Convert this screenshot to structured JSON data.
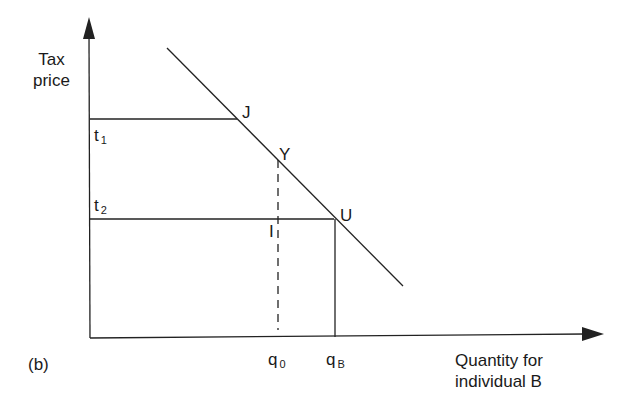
{
  "figure": {
    "panel_label": "(b)",
    "y_axis_label": [
      "Tax",
      "price"
    ],
    "x_axis_label": [
      "Quantity for",
      "individual B"
    ],
    "tax_levels": [
      {
        "symbol": "t",
        "subscript": "1"
      },
      {
        "symbol": "t",
        "subscript": "2"
      }
    ],
    "quantities": [
      {
        "symbol": "q",
        "subscript": "0"
      },
      {
        "symbol": "q",
        "subscript": "B"
      }
    ],
    "points": {
      "J": "J",
      "Y": "Y",
      "U": "U",
      "I": "I"
    },
    "colors": {
      "line": "#222222",
      "background": "#ffffff"
    }
  }
}
